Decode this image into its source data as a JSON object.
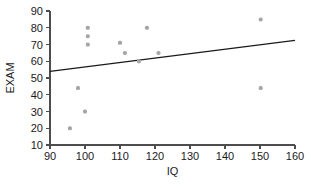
{
  "chart_data": {
    "type": "scatter",
    "title": "",
    "xlabel": "IQ",
    "ylabel": "EXAM",
    "xlim": [
      90,
      160
    ],
    "ylim": [
      10,
      90
    ],
    "xticks": [
      90,
      100,
      110,
      120,
      130,
      140,
      150,
      160
    ],
    "yticks": [
      10,
      20,
      30,
      40,
      50,
      60,
      70,
      80,
      90
    ],
    "grid": false,
    "legend": null,
    "point_color": "#a6a6a6",
    "line_color": "#1a1a1a",
    "axis_color": "#4d4d4d",
    "points": [
      {
        "x": 95.7,
        "y": 20
      },
      {
        "x": 98.0,
        "y": 44
      },
      {
        "x": 100.0,
        "y": 30
      },
      {
        "x": 100.8,
        "y": 80
      },
      {
        "x": 100.8,
        "y": 75
      },
      {
        "x": 100.8,
        "y": 70
      },
      {
        "x": 110.0,
        "y": 71
      },
      {
        "x": 111.4,
        "y": 65
      },
      {
        "x": 115.4,
        "y": 60
      },
      {
        "x": 117.7,
        "y": 80
      },
      {
        "x": 121.0,
        "y": 65
      },
      {
        "x": 150.2,
        "y": 85
      },
      {
        "x": 150.2,
        "y": 44
      }
    ],
    "trend_line": {
      "type": "linear-fit",
      "x_start": 90,
      "y_start": 54,
      "x_end": 160,
      "y_end": 72.5
    }
  }
}
